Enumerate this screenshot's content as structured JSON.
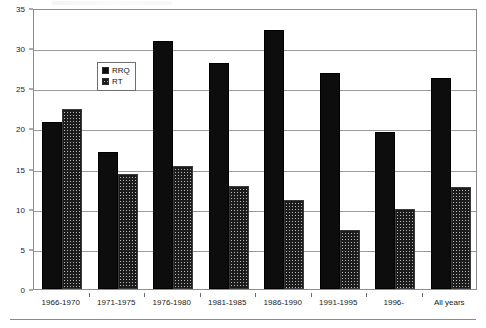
{
  "chart_data": {
    "type": "bar",
    "title": "",
    "subtitle": "",
    "xlabel": "",
    "ylabel": "",
    "ylim": [
      0,
      35
    ],
    "ytick_step": 5,
    "yticks": [
      0,
      5,
      10,
      15,
      20,
      25,
      30,
      35
    ],
    "grid": true,
    "grid_axis": "y",
    "legend_position": "upper-left-inside",
    "categories": [
      "1966-1970",
      "1971-1975",
      "1976-1980",
      "1981-1985",
      "1986-1990",
      "1991-1995",
      "1996-",
      "All years"
    ],
    "series": [
      {
        "name": "RRQ",
        "pattern": "solid",
        "color": "#0d0d0d",
        "values": [
          20.8,
          17.1,
          30.9,
          28.1,
          32.3,
          26.9,
          19.6,
          26.3
        ]
      },
      {
        "name": "RT",
        "pattern": "cross-hatch",
        "color": "#b9b9b9",
        "values": [
          22.4,
          14.3,
          15.3,
          12.8,
          11.1,
          7.4,
          10.0,
          12.7
        ]
      }
    ]
  },
  "legend": {
    "items": [
      {
        "label": "RRQ"
      },
      {
        "label": "RT"
      }
    ]
  },
  "axes": {
    "y_tick_labels": [
      "0",
      "5",
      "10",
      "15",
      "20",
      "25",
      "30",
      "35"
    ],
    "x_tick_labels": [
      "1966-1970",
      "1971-1975",
      "1976-1980",
      "1981-1985",
      "1986-1990",
      "1991-1995",
      "1996-",
      "All years"
    ]
  }
}
